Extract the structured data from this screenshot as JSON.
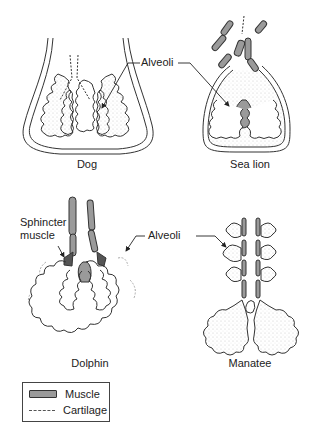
{
  "diagram": {
    "panels": [
      {
        "id": "dog",
        "caption": "Dog"
      },
      {
        "id": "sea-lion",
        "caption": "Sea lion"
      },
      {
        "id": "dolphin",
        "caption": "Dolphin"
      },
      {
        "id": "manatee",
        "caption": "Manatee"
      }
    ],
    "labels": {
      "alveoli_top": "Alveoli",
      "alveoli_bottom": "Alveoli",
      "sphincter_line1": "Sphincter",
      "sphincter_line2": "muscle"
    },
    "legend": {
      "items": [
        {
          "symbol": "muscle-swatch",
          "label": "Muscle"
        },
        {
          "symbol": "cartilage-dashed-line",
          "label": "Cartilage"
        }
      ]
    },
    "colors": {
      "muscle_fill": "#9a9a9a",
      "outline": "#333333",
      "stipple": "#bbbbbb"
    }
  }
}
